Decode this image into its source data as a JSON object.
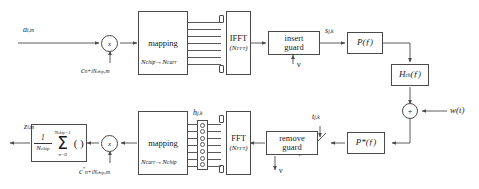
{
  "diagram": {
    "transmitter": {
      "input_label": "a",
      "input_sub": "i,m",
      "spread_mult_symbol": "x",
      "spread_code_label": "c",
      "spread_code_sub": "n+iN",
      "spread_code_sub2": "chip",
      "spread_code_sub3": ",m",
      "mapping_title": "mapping",
      "mapping_sub_from": "N",
      "mapping_sub_from_i": "chip",
      "mapping_arrow": "→",
      "mapping_sub_to": "N",
      "mapping_sub_to_i": "carr",
      "ifft_title": "IFFT",
      "ifft_sub": "(N",
      "ifft_sub_i": "FFT",
      "ifft_sub_end": ")",
      "guard_line1": "insert",
      "guard_line2": "guard",
      "guard_input": "ν",
      "tx_signal": "s",
      "tx_signal_sub": "j,k",
      "pulse_filter": "P(ƒ)"
    },
    "channel": {
      "channel_filter": "H",
      "channel_filter_sub": "ch",
      "channel_filter_tail": "(ƒ)",
      "adder_symbol": "+",
      "noise_label": "w(t)"
    },
    "receiver": {
      "matched_filter": "P",
      "matched_filter_star": "*",
      "matched_filter_tail": "(ƒ)",
      "sampler_label": "t",
      "sampler_sub": "j,k",
      "rx_signal": "r",
      "rx_signal_sub": "j,k",
      "remove_line1": "remove",
      "remove_line2": "guard",
      "remove_output": "ν",
      "fft_title": "FFT",
      "fft_sub": "(N",
      "fft_sub_i": "FFT",
      "fft_sub_end": ")",
      "channel_est": "h",
      "channel_est_sub": "j,k",
      "mapping_title": "mapping",
      "mapping_sub_from": "N",
      "mapping_sub_from_i": "carr",
      "mapping_arrow": "→",
      "mapping_sub_to": "N",
      "mapping_sub_to_i": "chip",
      "despread_mult_symbol": "x",
      "despread_code_label": "c",
      "despread_code_star": "*",
      "despread_code_sub": "n+iN",
      "despread_code_sub2": "chip",
      "despread_code_sub3": ",m",
      "sum_frac_num": "1",
      "sum_frac_den": "N",
      "sum_frac_den_i": "chip",
      "sum_upper": "N",
      "sum_upper_i": "chip",
      "sum_upper_end": "−1",
      "sum_glyph": "Σ",
      "sum_lower": "n=0",
      "sum_parens": "( )",
      "output_label": "z",
      "output_sub": "i,m"
    },
    "colors": {
      "line": "#4a4a4a",
      "background": "#ffffff",
      "text": "#1a1a1a"
    }
  }
}
